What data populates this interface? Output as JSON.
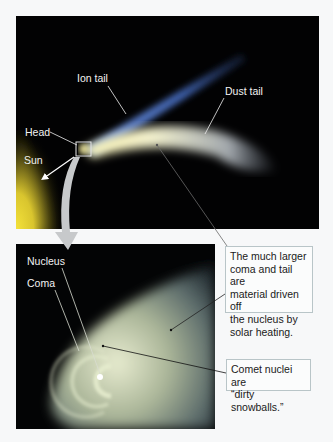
{
  "top_panel": {
    "labels": {
      "ion_tail": "Ion tail",
      "dust_tail": "Dust tail",
      "head": "Head",
      "sun": "Sun"
    }
  },
  "bottom_panel": {
    "labels": {
      "nucleus": "Nucleus",
      "coma": "Coma"
    }
  },
  "callouts": [
    {
      "lines": [
        "The much larger",
        "coma and tail are",
        "material driven off",
        "the nucleus by",
        "solar heating."
      ]
    },
    {
      "lines": [
        "Comet nuclei are",
        "“dirty snowballs.”"
      ]
    }
  ],
  "colors": {
    "background": "#f7f8f9",
    "space": "#020203",
    "sun": "#f2e034",
    "ion_tail": "#4a6fc0",
    "dust_tail": "#e8ecc8",
    "coma": "#c8d0a8",
    "zoom_arrow": "#c7c9cb",
    "callout_border": "#b9c5c8"
  }
}
